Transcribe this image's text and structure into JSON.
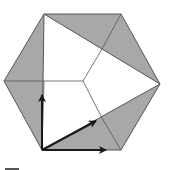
{
  "diagram": {
    "colors": {
      "background": "#ffffff",
      "shaded": "#a8a8a8",
      "edge": "#555555",
      "arrow": "#1a1a1a"
    },
    "hexagon": [
      [
        44,
        14
      ],
      [
        121,
        14
      ],
      [
        160,
        84
      ],
      [
        121,
        150
      ],
      [
        42,
        150
      ],
      [
        4,
        81
      ]
    ],
    "triangle": [
      [
        44,
        14
      ],
      [
        160,
        84
      ],
      [
        42,
        150
      ]
    ],
    "center": [
      83,
      81
    ],
    "y_edges": [
      [
        44,
        81
      ],
      [
        102,
        49
      ],
      [
        102,
        118
      ]
    ],
    "arrows": [
      {
        "name": "vertical",
        "from": [
          42,
          150
        ],
        "to": [
          42,
          95
        ]
      },
      {
        "name": "diagonal",
        "from": [
          42,
          150
        ],
        "to": [
          96,
          121
        ]
      },
      {
        "name": "horizontal",
        "from": [
          42,
          150
        ],
        "to": [
          106,
          150
        ]
      }
    ],
    "corner_mark": {
      "x1": 5,
      "y1": 169,
      "x2": 19,
      "y2": 169
    }
  }
}
